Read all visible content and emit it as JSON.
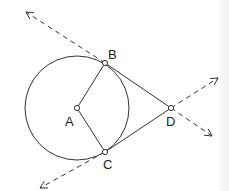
{
  "diagram": {
    "type": "geometry-tangent-lines",
    "circle": {
      "center_label": "A",
      "cx": 77,
      "cy": 108,
      "r": 52
    },
    "points": [
      {
        "label": "A",
        "x": 77,
        "y": 108,
        "label_x": 65,
        "label_y": 126
      },
      {
        "label": "B",
        "x": 105,
        "y": 63,
        "label_x": 108,
        "label_y": 59
      },
      {
        "label": "C",
        "x": 105,
        "y": 152,
        "label_x": 103,
        "label_y": 169
      },
      {
        "label": "D",
        "x": 171,
        "y": 108,
        "label_x": 166,
        "label_y": 126
      }
    ],
    "segments": [
      {
        "from": "A",
        "to": "B",
        "style": "solid"
      },
      {
        "from": "A",
        "to": "C",
        "style": "solid"
      },
      {
        "from": "B",
        "to": "D",
        "style": "solid"
      },
      {
        "from": "C",
        "to": "D",
        "style": "solid"
      }
    ],
    "rays": [
      {
        "through": "B",
        "from": [
          105,
          63
        ],
        "to": [
          26,
          12
        ],
        "style": "dashed",
        "arrow": true
      },
      {
        "through": "D",
        "from": [
          171,
          108
        ],
        "to": [
          218,
          78
        ],
        "style": "dashed",
        "arrow": true
      },
      {
        "through": "D",
        "from": [
          171,
          108
        ],
        "to": [
          212,
          136
        ],
        "style": "dashed",
        "arrow": true
      },
      {
        "through": "C",
        "from": [
          105,
          152
        ],
        "to": [
          40,
          188
        ],
        "style": "dashed",
        "arrow": true
      }
    ],
    "colors": {
      "stroke": "#333333",
      "point_fill": "#ffffff",
      "background": "#ffffff"
    }
  }
}
